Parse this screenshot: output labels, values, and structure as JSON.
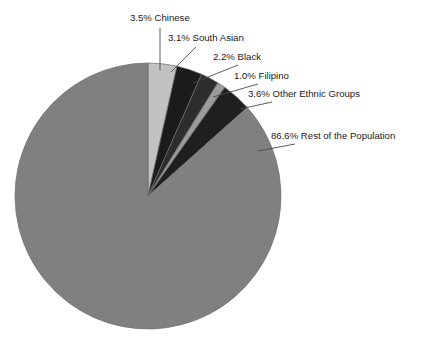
{
  "chart_data": {
    "type": "pie",
    "title": "",
    "subtitle": "",
    "xlabel": "",
    "ylabel": "",
    "legend_position": "none",
    "grid": false,
    "units": "percent",
    "start_angle_deg": 0,
    "direction": "clockwise",
    "categories": [
      "Chinese",
      "South Asian",
      "Black",
      "Filipino",
      "Other Ethnic Groups",
      "Rest of the Population"
    ],
    "values": [
      3.5,
      3.1,
      2.2,
      1.0,
      3.6,
      86.6
    ],
    "labels": [
      "3.5% Chinese",
      "3.1% South Asian",
      "2.2% Black",
      "1.0% Filipino",
      "3.6% Other Ethnic Groups",
      "86.6% Rest of the Population"
    ],
    "slice_colors": [
      "#c2c2c2",
      "#1b1b1b",
      "#2d2d2d",
      "#9b9b9b",
      "#1f1f1f",
      "#808080"
    ],
    "slices": [
      {
        "name": "chinese",
        "label": "3.5% Chinese",
        "value": 3.5,
        "color": "#c2c2c2",
        "label_x": 130,
        "label_y": 21,
        "leader": "M 160,28 L 160,70"
      },
      {
        "name": "south-asian",
        "label": "3.1% South Asian",
        "value": 3.1,
        "color": "#1b1b1b",
        "label_x": 168,
        "label_y": 41,
        "leader": "M 196,47 L 171,72"
      },
      {
        "name": "black",
        "label": "2.2% Black",
        "value": 2.2,
        "color": "#2d2d2d",
        "label_x": 213,
        "label_y": 60,
        "leader": "M 238,65 L 193,83"
      },
      {
        "name": "filipino",
        "label": "1.0% Filipino",
        "value": 1.0,
        "color": "#9b9b9b",
        "label_x": 234,
        "label_y": 79,
        "leader": "M 258,84 L 213,97"
      },
      {
        "name": "other-ethnic-groups",
        "label": "3.6% Other Ethnic Groups",
        "value": 3.6,
        "color": "#1f1f1f",
        "label_x": 248,
        "label_y": 97,
        "leader": "M 272,102 L 240,109"
      },
      {
        "name": "rest-of-population",
        "label": "86.6% Rest of the Population",
        "value": 86.6,
        "color": "#808080",
        "label_x": 271,
        "label_y": 139,
        "leader": "M 295,144 L 258,151"
      }
    ],
    "geometry": {
      "center_x": 148,
      "center_y": 196,
      "radius": 133
    }
  }
}
